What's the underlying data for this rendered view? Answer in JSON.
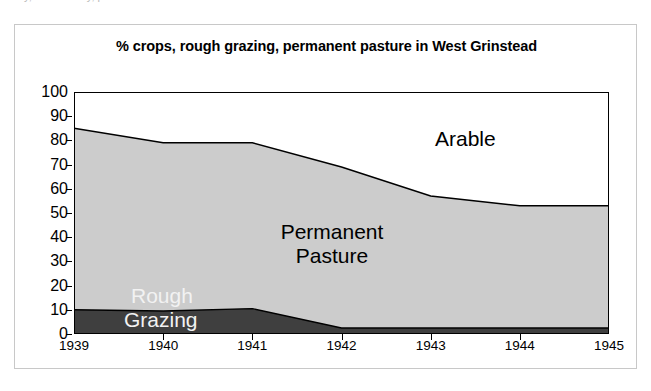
{
  "page": {
    "cropped_text_above": "y, ... to be ... y, pasture increased."
  },
  "chart": {
    "title": "% crops, rough grazing, permanent pasture in West Grinstead"
  },
  "chart_data": {
    "type": "area",
    "title": "% crops, rough grazing, permanent pasture in West Grinstead",
    "subtitle": "",
    "xlabel": "",
    "ylabel": "",
    "x": [
      "1939",
      "1940",
      "1941",
      "1942",
      "1943",
      "1944",
      "1945"
    ],
    "categories": [
      "1939",
      "1940",
      "1941",
      "1942",
      "1943",
      "1944",
      "1945"
    ],
    "stacked": true,
    "grid": false,
    "legend_position": "in-plot-labels",
    "ylim": [
      0,
      100
    ],
    "y_ticks": [
      0,
      10,
      20,
      30,
      40,
      50,
      60,
      70,
      80,
      90,
      100
    ],
    "series": [
      {
        "name": "Rough Grazing",
        "label": "Rough Grazing",
        "color": "#3f3f3f",
        "text_color": "#f2f2f2",
        "values": [
          10,
          9.5,
          10.5,
          2.5,
          2.5,
          2.5,
          2.5
        ]
      },
      {
        "name": "Permanent Pasture",
        "label": "Permanent Pasture",
        "color": "#cccccc",
        "text_color": "#000000",
        "values": [
          75,
          69.5,
          68.5,
          66.5,
          54.5,
          50.5,
          50.5
        ]
      },
      {
        "name": "Arable",
        "label": "Arable",
        "color": "#ffffff",
        "text_color": "#000000",
        "values": [
          15,
          21,
          21,
          31,
          43,
          47,
          47
        ]
      }
    ],
    "cumulative_top_boundaries": {
      "rough_grazing_top": [
        10,
        9.5,
        10.5,
        2.5,
        2.5,
        2.5,
        2.5
      ],
      "permanent_pasture_top": [
        85,
        79,
        79,
        69,
        57,
        53,
        53
      ]
    },
    "labels": {
      "arable": "Arable",
      "permanent_pasture_line1": "Permanent",
      "permanent_pasture_line2": "Pasture",
      "rough": "Rough",
      "grazing": "Grazing"
    }
  }
}
